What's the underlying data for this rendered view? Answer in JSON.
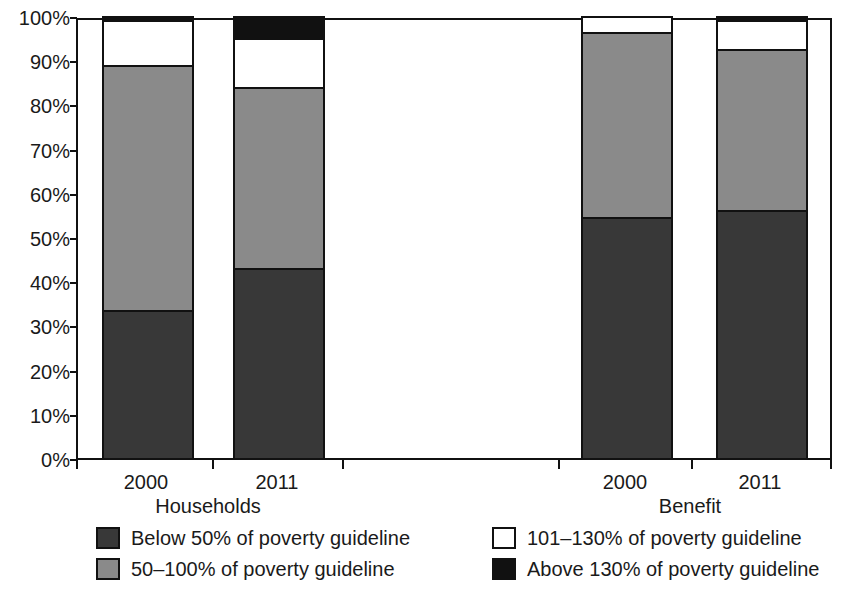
{
  "chart_data": {
    "type": "bar",
    "subtype": "stacked-percentage",
    "title": "",
    "xlabel": "",
    "ylabel": "",
    "ylim": [
      0,
      100
    ],
    "y_unit": "%",
    "grid": false,
    "legend_position": "bottom",
    "categories": [
      "2000",
      "2011",
      "2000",
      "2011"
    ],
    "groups": [
      {
        "label": "Households",
        "categories": [
          "2000",
          "2011"
        ]
      },
      {
        "label": "Benefit",
        "categories": [
          "2000",
          "2011"
        ]
      }
    ],
    "yticks": [
      "0%",
      "10%",
      "20%",
      "30%",
      "40%",
      "50%",
      "60%",
      "70%",
      "80%",
      "90%",
      "100%"
    ],
    "ytick_values": [
      0,
      10,
      20,
      30,
      40,
      50,
      60,
      70,
      80,
      90,
      100
    ],
    "series": [
      {
        "name": "Below 50% of poverty guideline",
        "color": "#383838",
        "swatch": "dark",
        "values": [
          33.5,
          43.0,
          54.5,
          56.0
        ]
      },
      {
        "name": "50–100% of poverty guideline",
        "color": "#8a8a8a",
        "swatch": "gray",
        "values": [
          55.5,
          41.0,
          42.0,
          36.5
        ]
      },
      {
        "name": "101–130% of poverty guideline",
        "color": "#ffffff",
        "swatch": "white",
        "values": [
          10.0,
          11.0,
          3.5,
          6.5
        ]
      },
      {
        "name": "Above 130% of poverty guideline",
        "color": "#111111",
        "swatch": "black",
        "values": [
          1.0,
          5.0,
          0.0,
          1.0
        ]
      }
    ],
    "bars": [
      {
        "group": "Households",
        "category": "2000",
        "segments": [
          {
            "series": "Below 50% of poverty guideline",
            "value": 33.5,
            "from": 0.0,
            "to": 33.5
          },
          {
            "series": "50–100% of poverty guideline",
            "value": 55.5,
            "from": 33.5,
            "to": 89.0
          },
          {
            "series": "101–130% of poverty guideline",
            "value": 10.0,
            "from": 89.0,
            "to": 99.0
          },
          {
            "series": "Above 130% of poverty guideline",
            "value": 1.0,
            "from": 99.0,
            "to": 100.0
          }
        ]
      },
      {
        "group": "Households",
        "category": "2011",
        "segments": [
          {
            "series": "Below 50% of poverty guideline",
            "value": 43.0,
            "from": 0.0,
            "to": 43.0
          },
          {
            "series": "50–100% of poverty guideline",
            "value": 41.0,
            "from": 43.0,
            "to": 84.0
          },
          {
            "series": "101–130% of poverty guideline",
            "value": 11.0,
            "from": 84.0,
            "to": 95.0
          },
          {
            "series": "Above 130% of poverty guideline",
            "value": 5.0,
            "from": 95.0,
            "to": 100.0
          }
        ]
      },
      {
        "group": "Benefit",
        "category": "2000",
        "segments": [
          {
            "series": "Below 50% of poverty guideline",
            "value": 54.5,
            "from": 0.0,
            "to": 54.5
          },
          {
            "series": "50–100% of poverty guideline",
            "value": 42.0,
            "from": 54.5,
            "to": 96.5
          },
          {
            "series": "101–130% of poverty guideline",
            "value": 3.5,
            "from": 96.5,
            "to": 100.0
          },
          {
            "series": "Above 130% of poverty guideline",
            "value": 0.0,
            "from": 100.0,
            "to": 100.0
          }
        ]
      },
      {
        "group": "Benefit",
        "category": "2011",
        "segments": [
          {
            "series": "Below 50% of poverty guideline",
            "value": 56.0,
            "from": 0.0,
            "to": 56.0
          },
          {
            "series": "50–100% of poverty guideline",
            "value": 36.5,
            "from": 56.0,
            "to": 92.5
          },
          {
            "series": "101–130% of poverty guideline",
            "value": 6.5,
            "from": 92.5,
            "to": 99.0
          },
          {
            "series": "Above 130% of poverty guideline",
            "value": 1.0,
            "from": 99.0,
            "to": 100.0
          }
        ]
      }
    ],
    "legend": [
      {
        "label": "Below 50% of poverty guideline",
        "color": "#383838",
        "swatch": "dark"
      },
      {
        "label": "50–100% of poverty guideline",
        "color": "#8a8a8a",
        "swatch": "gray"
      },
      {
        "label": "101–130% of poverty guideline",
        "color": "#ffffff",
        "swatch": "white"
      },
      {
        "label": "Above 130% of poverty guideline",
        "color": "#111111",
        "swatch": "black"
      }
    ]
  },
  "axis": {
    "yticks": [
      "0%",
      "10%",
      "20%",
      "30%",
      "40%",
      "50%",
      "60%",
      "70%",
      "80%",
      "90%",
      "100%"
    ],
    "xticks": [
      "2000",
      "2011",
      "2000",
      "2011"
    ],
    "xgroups": [
      "Households",
      "Benefit"
    ]
  },
  "legend": {
    "items": [
      {
        "label": "Below 50% of poverty guideline"
      },
      {
        "label": "50–100% of poverty guideline"
      },
      {
        "label": "101–130% of poverty guideline"
      },
      {
        "label": "Above 130% of poverty guideline"
      }
    ]
  },
  "colors": {
    "dark": "#383838",
    "gray": "#8a8a8a",
    "white": "#ffffff",
    "black": "#111111",
    "axis": "#111111",
    "text": "#1a1a1a",
    "background": "#ffffff"
  }
}
